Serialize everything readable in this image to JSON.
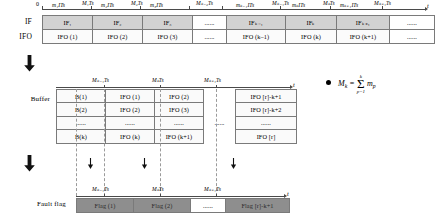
{
  "diagram": {
    "axis_symbol": "t",
    "origin_label": "0"
  },
  "top_section": {
    "row_labels": {
      "if": "IF",
      "ifo": "IFO"
    },
    "tick_labels_interval": [
      "m₁ITs",
      "m₂ITs",
      "m₃ITs",
      "mₖ₋₁ITs",
      "mₖITs",
      "mₖ₊₁ITs"
    ],
    "tick_labels_boundary": [
      "M₁Ts",
      "M₂Ts",
      "Mₖ₋₂Ts",
      "Mₖ₋₁Ts",
      "MₖTs",
      "Mₖ₊₁Ts"
    ],
    "if_cells": [
      "IF₁",
      "IF₂",
      "IF₃",
      "......",
      "IFₖ₋₁",
      "IFₖ",
      "IFₖ₊₁",
      "......"
    ],
    "ifo_cells": [
      "IFO (1)",
      "IFO (2)",
      "IFO (3)",
      "......",
      "IFO (k–1)",
      "IFO (k)",
      "IFO (k+1)",
      "......"
    ]
  },
  "buffer_section": {
    "row_label": "Buffer",
    "tick_labels": [
      "Mₖ₋₁Ts",
      "MₖTs",
      "Mₖ₊₁Ts"
    ],
    "rows": [
      [
        "B(1)",
        "IFO (1)",
        "IFO (2)",
        "",
        "IFO [r]-k+1"
      ],
      [
        "B(2)",
        "IFO (2)",
        "IFO (3)",
        "......",
        "IFO [r]-k+2"
      ],
      [
        "......",
        "......",
        "......",
        "",
        "......"
      ],
      [
        "B(k)",
        "IFO (k)",
        "IFO (k+1)",
        "",
        "IFO [r]"
      ]
    ]
  },
  "fault_section": {
    "row_label": "Fault flag",
    "tick_labels": [
      "Mₖ₋₁Ts",
      "MₖTs",
      "Mₖ₊₁Ts"
    ],
    "cells": [
      "Flag (1)",
      "Flag (2)",
      "......",
      "Flag [r]-k+1"
    ]
  },
  "legend": {
    "formula_lhs": "M",
    "formula_lhs_sub": "k",
    "formula_eq": "=",
    "sigma_upper": "k",
    "sigma_lower": "p=1",
    "formula_term": "m",
    "formula_term_sub": "p"
  }
}
